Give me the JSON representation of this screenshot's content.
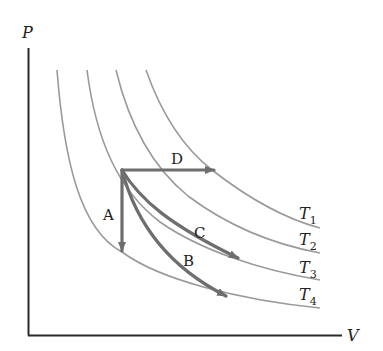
{
  "diagram": {
    "type": "PV diagram with isotherms",
    "axes": {
      "y_label": "P",
      "x_label": "V"
    },
    "isotherms": [
      {
        "label": "T",
        "subscript": "1"
      },
      {
        "label": "T",
        "subscript": "2"
      },
      {
        "label": "T",
        "subscript": "3"
      },
      {
        "label": "T",
        "subscript": "4"
      }
    ],
    "paths": [
      {
        "label": "A",
        "description": "vertical downward (isovolumetric)"
      },
      {
        "label": "B",
        "description": "curved down-right to T4"
      },
      {
        "label": "C",
        "description": "curved down-right to T3"
      },
      {
        "label": "D",
        "description": "horizontal rightward (isobaric)"
      }
    ],
    "colors": {
      "axis": "#2a2a2a",
      "isotherm": "#9a9a9a",
      "path_arrow": "#6e6e6e",
      "text": "#222222"
    }
  }
}
